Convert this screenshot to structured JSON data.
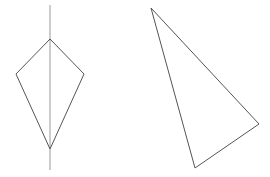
{
  "figure": {
    "width": 270,
    "height": 177,
    "background": "#ffffff",
    "stroke_color": "#555555",
    "axis_color": "#999999"
  },
  "shapes": [
    {
      "name": "kite",
      "type": "polygon",
      "points": [
        [
          50,
          39
        ],
        [
          84,
          74
        ],
        [
          50,
          149
        ],
        [
          16,
          74
        ]
      ]
    },
    {
      "name": "symmetry-axis",
      "type": "line",
      "points": [
        [
          50,
          5
        ],
        [
          50,
          170
        ]
      ]
    },
    {
      "name": "triangle",
      "type": "polygon",
      "points": [
        [
          151,
          8
        ],
        [
          259,
          124
        ],
        [
          195,
          168
        ]
      ]
    }
  ]
}
